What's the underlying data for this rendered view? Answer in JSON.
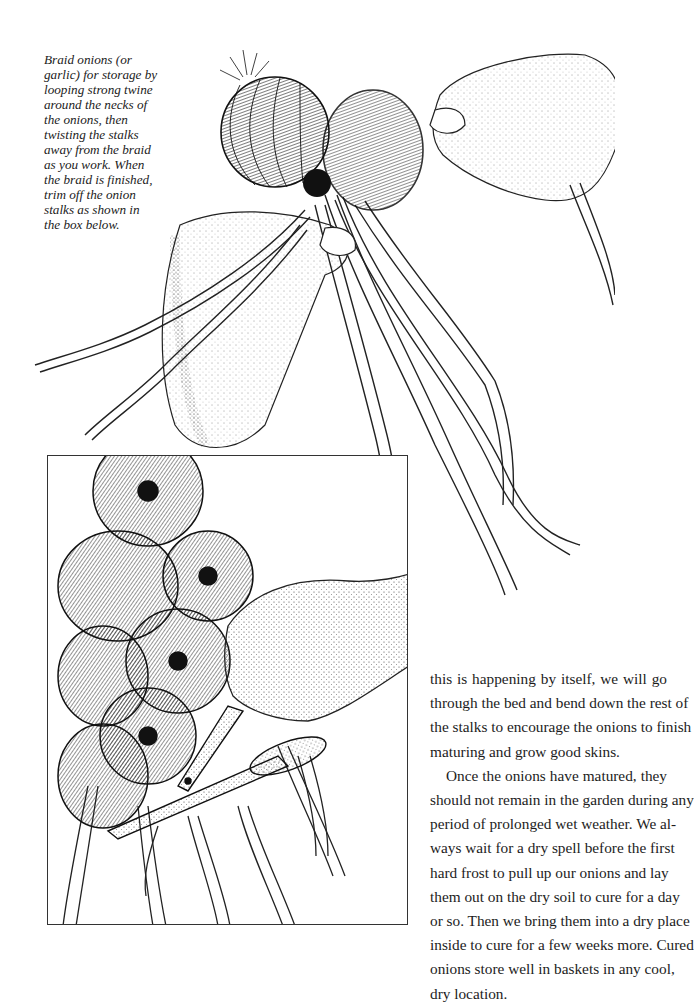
{
  "figure": {
    "caption_lines": [
      "Braid onions (or",
      "garlic) for storage by",
      "looping strong twine",
      "around the necks of",
      "the onions, then",
      "twisting the stalks",
      "away from the braid",
      "as you work. When",
      "the braid is finished,",
      "trim off the onion",
      "stalks as shown in",
      "the box below."
    ]
  },
  "body": {
    "lines": [
      "this is happening by itself, we will go",
      "through the bed and bend down the rest of",
      "the stalks to encourage the onions to finish",
      "maturing and grow good skins.",
      "Once the onions have matured, they",
      "should not remain in the garden during any",
      "period of prolonged wet weather. We al-",
      "ways wait for a dry spell before the first",
      "hard frost to pull up our onions and lay",
      "them out on the dry soil to cure for a day",
      "or so. Then we bring them into a dry place",
      "inside to cure for a few weeks more. Cured",
      "onions store well in baskets in any cool,",
      "dry location."
    ]
  },
  "colors": {
    "ink": "#1c1c1c",
    "paper": "#ffffff"
  }
}
